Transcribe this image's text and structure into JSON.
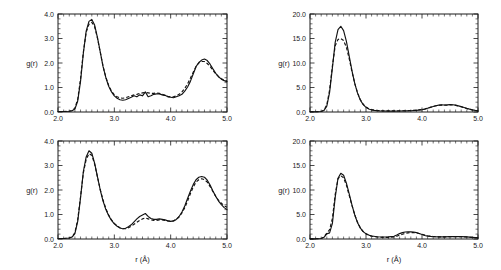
{
  "figure": {
    "background": "#ffffff",
    "ink": "#121212",
    "panel_count": 4
  },
  "chart_data": [
    {
      "id": "top-left",
      "type": "line",
      "title": "",
      "xlabel": "r (Å)",
      "ylabel": "g(r)",
      "xlim": [
        2.0,
        5.0
      ],
      "ylim": [
        0.0,
        4.0
      ],
      "xticks": [
        2.0,
        3.0,
        4.0,
        5.0
      ],
      "xticklabels": [
        "2.0",
        "3.0",
        "4.0",
        "5.0"
      ],
      "yticks": [
        0.0,
        1.0,
        2.0,
        3.0,
        4.0
      ],
      "yticklabels": [
        "0.0",
        "1.0",
        "2.0",
        "3.0",
        "4.0"
      ],
      "grid": false,
      "legend": "none",
      "x": [
        2.0,
        2.1,
        2.2,
        2.25,
        2.3,
        2.35,
        2.4,
        2.45,
        2.5,
        2.55,
        2.6,
        2.65,
        2.7,
        2.75,
        2.8,
        2.85,
        2.9,
        2.95,
        3.0,
        3.05,
        3.1,
        3.15,
        3.2,
        3.25,
        3.3,
        3.35,
        3.4,
        3.45,
        3.5,
        3.55,
        3.6,
        3.65,
        3.7,
        3.75,
        3.8,
        3.85,
        3.9,
        3.95,
        4.0,
        4.05,
        4.1,
        4.15,
        4.2,
        4.25,
        4.3,
        4.35,
        4.4,
        4.45,
        4.5,
        4.55,
        4.6,
        4.65,
        4.7,
        4.75,
        4.8,
        4.85,
        4.9,
        4.95,
        5.0
      ],
      "series": [
        {
          "name": "solid",
          "style": "solid",
          "values": [
            0.02,
            0.02,
            0.03,
            0.05,
            0.12,
            0.45,
            1.25,
            2.4,
            3.3,
            3.7,
            3.78,
            3.55,
            3.05,
            2.45,
            1.85,
            1.4,
            1.05,
            0.82,
            0.66,
            0.56,
            0.5,
            0.48,
            0.5,
            0.55,
            0.6,
            0.66,
            0.62,
            0.7,
            0.66,
            0.82,
            0.62,
            0.66,
            0.72,
            0.74,
            0.74,
            0.7,
            0.68,
            0.62,
            0.6,
            0.58,
            0.62,
            0.66,
            0.72,
            0.85,
            1.02,
            1.25,
            1.55,
            1.85,
            2.02,
            2.12,
            2.16,
            2.1,
            1.95,
            1.76,
            1.58,
            1.44,
            1.34,
            1.28,
            1.24
          ]
        },
        {
          "name": "dashed",
          "style": "dashed",
          "values": [
            0.02,
            0.02,
            0.03,
            0.06,
            0.16,
            0.52,
            1.35,
            2.45,
            3.25,
            3.58,
            3.66,
            3.48,
            3.02,
            2.44,
            1.86,
            1.42,
            1.08,
            0.85,
            0.7,
            0.62,
            0.58,
            0.56,
            0.58,
            0.62,
            0.66,
            0.7,
            0.72,
            0.76,
            0.78,
            0.8,
            0.78,
            0.76,
            0.76,
            0.78,
            0.76,
            0.72,
            0.68,
            0.64,
            0.62,
            0.62,
            0.66,
            0.72,
            0.82,
            0.96,
            1.15,
            1.38,
            1.62,
            1.86,
            2.0,
            2.06,
            2.06,
            1.98,
            1.86,
            1.7,
            1.56,
            1.44,
            1.36,
            1.3,
            1.26
          ]
        }
      ]
    },
    {
      "id": "top-right",
      "type": "line",
      "title": "",
      "xlabel": "r (Å)",
      "ylabel": "g(r)",
      "xlim": [
        2.0,
        5.0
      ],
      "ylim": [
        0.0,
        20.0
      ],
      "xticks": [
        2.0,
        3.0,
        4.0,
        5.0
      ],
      "xticklabels": [
        "2.0",
        "3.0",
        "4.0",
        "5.0"
      ],
      "yticks": [
        0.0,
        5.0,
        10.0,
        15.0,
        20.0
      ],
      "yticklabels": [
        "0.0",
        "5.0",
        "10.0",
        "15.0",
        "20.0"
      ],
      "grid": false,
      "legend": "none",
      "x": [
        2.0,
        2.1,
        2.2,
        2.25,
        2.3,
        2.35,
        2.4,
        2.45,
        2.5,
        2.55,
        2.6,
        2.65,
        2.7,
        2.75,
        2.8,
        2.85,
        2.9,
        2.95,
        3.0,
        3.05,
        3.1,
        3.15,
        3.2,
        3.25,
        3.3,
        3.4,
        3.5,
        3.6,
        3.7,
        3.8,
        3.9,
        4.0,
        4.05,
        4.1,
        4.15,
        4.2,
        4.25,
        4.3,
        4.35,
        4.4,
        4.45,
        4.5,
        4.55,
        4.6,
        4.65,
        4.7,
        4.75,
        4.8,
        4.85,
        4.9,
        4.95,
        5.0
      ],
      "series": [
        {
          "name": "solid",
          "style": "solid",
          "values": [
            0.05,
            0.05,
            0.1,
            0.3,
            1.2,
            4.0,
            9.0,
            14.2,
            16.8,
            17.5,
            16.6,
            14.4,
            11.4,
            8.4,
            5.8,
            3.8,
            2.4,
            1.5,
            0.95,
            0.62,
            0.42,
            0.32,
            0.26,
            0.22,
            0.2,
            0.18,
            0.18,
            0.2,
            0.22,
            0.26,
            0.32,
            0.45,
            0.58,
            0.76,
            0.95,
            1.12,
            1.28,
            1.4,
            1.45,
            1.42,
            1.44,
            1.5,
            1.48,
            1.4,
            1.26,
            1.1,
            0.92,
            0.74,
            0.58,
            0.44,
            0.32,
            0.24
          ]
        },
        {
          "name": "dashed",
          "style": "dashed",
          "values": [
            0.05,
            0.05,
            0.12,
            0.38,
            1.45,
            4.5,
            9.4,
            13.5,
            14.8,
            15.0,
            14.6,
            13.2,
            10.9,
            8.2,
            5.8,
            3.9,
            2.5,
            1.58,
            1.02,
            0.68,
            0.48,
            0.36,
            0.3,
            0.26,
            0.24,
            0.22,
            0.22,
            0.24,
            0.26,
            0.3,
            0.38,
            0.5,
            0.62,
            0.8,
            0.98,
            1.14,
            1.28,
            1.38,
            1.42,
            1.4,
            1.4,
            1.44,
            1.42,
            1.34,
            1.22,
            1.06,
            0.88,
            0.7,
            0.56,
            0.42,
            0.3,
            0.22
          ]
        }
      ]
    },
    {
      "id": "bottom-left",
      "type": "line",
      "title": "",
      "xlabel": "r (Å)",
      "ylabel": "g(r)",
      "xlim": [
        2.0,
        5.0
      ],
      "ylim": [
        0.0,
        4.0
      ],
      "xticks": [
        2.0,
        3.0,
        4.0,
        5.0
      ],
      "xticklabels": [
        "2.0",
        "3.0",
        "4.0",
        "5.0"
      ],
      "yticks": [
        0.0,
        1.0,
        2.0,
        3.0,
        4.0
      ],
      "yticklabels": [
        "0.0",
        "1.0",
        "2.0",
        "3.0",
        "4.0"
      ],
      "grid": false,
      "legend": "none",
      "x": [
        2.0,
        2.1,
        2.2,
        2.25,
        2.3,
        2.35,
        2.4,
        2.45,
        2.5,
        2.55,
        2.6,
        2.65,
        2.7,
        2.75,
        2.8,
        2.85,
        2.9,
        2.95,
        3.0,
        3.05,
        3.1,
        3.15,
        3.2,
        3.25,
        3.3,
        3.35,
        3.4,
        3.45,
        3.5,
        3.55,
        3.6,
        3.65,
        3.7,
        3.75,
        3.8,
        3.85,
        3.9,
        3.95,
        4.0,
        4.05,
        4.1,
        4.15,
        4.2,
        4.25,
        4.3,
        4.35,
        4.4,
        4.45,
        4.5,
        4.55,
        4.6,
        4.65,
        4.7,
        4.75,
        4.8,
        4.85,
        4.9,
        4.95,
        5.0
      ],
      "series": [
        {
          "name": "solid",
          "style": "solid",
          "values": [
            0.02,
            0.02,
            0.04,
            0.08,
            0.22,
            0.72,
            1.68,
            2.75,
            3.35,
            3.6,
            3.5,
            3.1,
            2.55,
            2.0,
            1.55,
            1.2,
            0.95,
            0.76,
            0.62,
            0.52,
            0.45,
            0.42,
            0.44,
            0.5,
            0.58,
            0.7,
            0.82,
            0.92,
            0.98,
            1.04,
            0.92,
            0.84,
            0.8,
            0.8,
            0.82,
            0.8,
            0.78,
            0.74,
            0.72,
            0.74,
            0.8,
            0.92,
            1.1,
            1.35,
            1.65,
            1.95,
            2.22,
            2.42,
            2.52,
            2.55,
            2.52,
            2.4,
            2.2,
            1.96,
            1.74,
            1.55,
            1.4,
            1.28,
            1.2
          ]
        },
        {
          "name": "dashed",
          "style": "dashed",
          "values": [
            0.02,
            0.02,
            0.04,
            0.09,
            0.26,
            0.8,
            1.72,
            2.7,
            3.25,
            3.48,
            3.42,
            3.06,
            2.54,
            2.02,
            1.58,
            1.24,
            0.98,
            0.78,
            0.64,
            0.54,
            0.46,
            0.42,
            0.42,
            0.46,
            0.52,
            0.6,
            0.68,
            0.76,
            0.82,
            0.86,
            0.82,
            0.78,
            0.76,
            0.76,
            0.78,
            0.78,
            0.76,
            0.74,
            0.72,
            0.74,
            0.8,
            0.9,
            1.06,
            1.28,
            1.55,
            1.85,
            2.12,
            2.32,
            2.42,
            2.46,
            2.42,
            2.32,
            2.14,
            1.94,
            1.74,
            1.58,
            1.46,
            1.36,
            1.3
          ]
        }
      ]
    },
    {
      "id": "bottom-right",
      "type": "line",
      "title": "",
      "xlabel": "r (Å)",
      "ylabel": "g(r)",
      "xlim": [
        2.0,
        5.0
      ],
      "ylim": [
        0.0,
        20.0
      ],
      "xticks": [
        2.0,
        3.0,
        4.0,
        5.0
      ],
      "xticklabels": [
        "2.0",
        "3.0",
        "4.0",
        "5.0"
      ],
      "yticks": [
        0.0,
        5.0,
        10.0,
        15.0,
        20.0
      ],
      "yticklabels": [
        "0.0",
        "5.0",
        "10.0",
        "15.0",
        "20.0"
      ],
      "grid": false,
      "legend": "none",
      "x": [
        2.0,
        2.1,
        2.2,
        2.25,
        2.3,
        2.35,
        2.4,
        2.45,
        2.5,
        2.55,
        2.6,
        2.65,
        2.7,
        2.75,
        2.8,
        2.85,
        2.9,
        2.95,
        3.0,
        3.05,
        3.1,
        3.2,
        3.3,
        3.4,
        3.5,
        3.55,
        3.6,
        3.65,
        3.7,
        3.75,
        3.8,
        3.85,
        3.9,
        3.95,
        4.0,
        4.05,
        4.1,
        4.2,
        4.3,
        4.4,
        4.5,
        4.6,
        4.7,
        4.8,
        4.9,
        5.0
      ],
      "series": [
        {
          "name": "solid",
          "style": "solid",
          "values": [
            0.04,
            0.04,
            0.1,
            0.35,
            1.05,
            1.25,
            3.2,
            8.5,
            12.4,
            13.4,
            13.0,
            11.4,
            9.2,
            6.9,
            4.9,
            3.3,
            2.2,
            1.5,
            1.05,
            0.8,
            0.62,
            0.45,
            0.4,
            0.42,
            0.55,
            0.8,
            1.1,
            1.3,
            1.42,
            1.46,
            1.48,
            1.42,
            1.3,
            1.12,
            0.92,
            0.72,
            0.58,
            0.45,
            0.42,
            0.44,
            0.48,
            0.5,
            0.48,
            0.42,
            0.34,
            0.26
          ]
        },
        {
          "name": "dashed",
          "style": "dashed",
          "values": [
            0.04,
            0.04,
            0.12,
            0.42,
            1.2,
            1.9,
            4.2,
            9.1,
            12.3,
            12.9,
            12.5,
            11.0,
            8.9,
            6.8,
            4.9,
            3.35,
            2.25,
            1.52,
            1.05,
            0.78,
            0.58,
            0.4,
            0.34,
            0.34,
            0.42,
            0.56,
            0.78,
            0.98,
            1.14,
            1.24,
            1.3,
            1.3,
            1.24,
            1.12,
            0.96,
            0.8,
            0.66,
            0.5,
            0.44,
            0.44,
            0.46,
            0.48,
            0.46,
            0.4,
            0.32,
            0.24
          ]
        }
      ]
    }
  ]
}
